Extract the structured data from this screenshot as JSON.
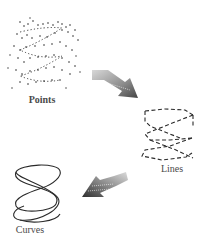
{
  "diagram": {
    "stages": [
      {
        "id": "points",
        "label": "Points"
      },
      {
        "id": "lines",
        "label": "Lines"
      },
      {
        "id": "curves",
        "label": "Curves"
      }
    ],
    "arrows": [
      {
        "from": "points",
        "to": "lines"
      },
      {
        "from": "lines",
        "to": "curves"
      }
    ],
    "colors": {
      "stroke": "#2a2a2a",
      "arrow_light": "#c8c8c8",
      "arrow_dark": "#555555",
      "label": "#4a4a4a"
    }
  }
}
